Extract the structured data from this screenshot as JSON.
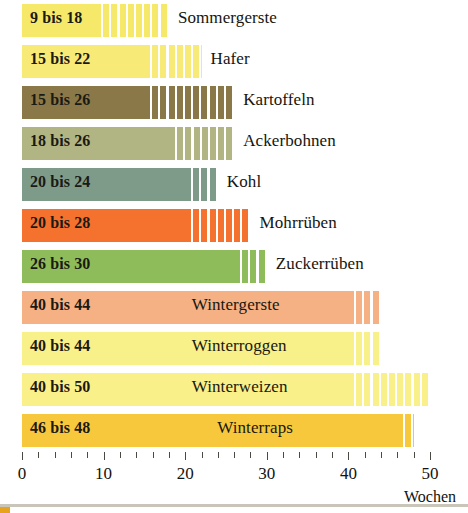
{
  "chart_data": {
    "type": "bar",
    "title": "",
    "subtitle": "",
    "xlabel": "Wochen",
    "ylabel": "",
    "xlim": [
      0,
      50
    ],
    "x_ticks_major": [
      0,
      10,
      20,
      30,
      40,
      50
    ],
    "x_tick_labels": [
      "0",
      "10",
      "20",
      "30",
      "40",
      "50"
    ],
    "x_minor_tick_step": 2,
    "grid": false,
    "legend": "none",
    "orientation": "horizontal",
    "value_unit": "Wochen",
    "note": "Each row shows a growing period range in weeks: solid segment = lower bound, hatched/striped segment extends to upper bound.",
    "categories": [
      "Sommergerste",
      "Hafer",
      "Kartoffeln",
      "Ackerbohnen",
      "Kohl",
      "Mohrrüben",
      "Zuckerrüben",
      "Wintergerste",
      "Winterroggen",
      "Winterweizen",
      "Winterraps"
    ],
    "values_min": [
      9,
      15,
      15,
      18,
      20,
      20,
      26,
      40,
      40,
      40,
      46
    ],
    "values_max": [
      18,
      22,
      26,
      26,
      24,
      28,
      30,
      44,
      44,
      50,
      48
    ],
    "bars": [
      {
        "crop": "Sommergerste",
        "range_label": "9 bis 18",
        "min": 9,
        "max": 18,
        "color": "#f6e96a",
        "label_inside": false
      },
      {
        "crop": "Hafer",
        "range_label": "15 bis 22",
        "min": 15,
        "max": 22,
        "color": "#f7ea77",
        "label_inside": false
      },
      {
        "crop": "Kartoffeln",
        "range_label": "15 bis 26",
        "min": 15,
        "max": 26,
        "color": "#8a7848",
        "label_inside": false
      },
      {
        "crop": "Ackerbohnen",
        "range_label": "18 bis 26",
        "min": 18,
        "max": 26,
        "color": "#b0b583",
        "label_inside": false
      },
      {
        "crop": "Kohl",
        "range_label": "20 bis 24",
        "min": 20,
        "max": 24,
        "color": "#7e9b8a",
        "label_inside": false
      },
      {
        "crop": "Mohrrüben",
        "range_label": "20 bis 28",
        "min": 20,
        "max": 28,
        "color": "#f4712e",
        "label_inside": false
      },
      {
        "crop": "Zuckerrüben",
        "range_label": "26 bis 30",
        "min": 26,
        "max": 30,
        "color": "#8fbc5a",
        "label_inside": false
      },
      {
        "crop": "Wintergerste",
        "range_label": "40 bis 44",
        "min": 40,
        "max": 44,
        "color": "#f5b183",
        "label_inside": true
      },
      {
        "crop": "Winterroggen",
        "range_label": "40 bis 44",
        "min": 40,
        "max": 44,
        "color": "#f8f089",
        "label_inside": true
      },
      {
        "crop": "Winterweizen",
        "range_label": "40 bis 50",
        "min": 40,
        "max": 50,
        "color": "#faf08a",
        "label_inside": true
      },
      {
        "crop": "Winterraps",
        "range_label": "46 bis 48",
        "min": 46,
        "max": 48,
        "color": "#f8c83c",
        "label_inside": true
      }
    ]
  },
  "axis": {
    "unit_label": "Wochen",
    "tick_labels": [
      "0",
      "10",
      "20",
      "30",
      "40",
      "50"
    ]
  }
}
